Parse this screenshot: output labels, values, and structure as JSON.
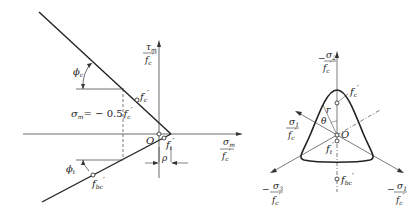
{
  "left_diagram": {
    "y_axis_label": {
      "num": "τ",
      "num_sub": "m",
      "den": "f",
      "den_sub": "c",
      "den_prime": "′"
    },
    "x_axis_label": {
      "num": "σ",
      "num_sub": "m",
      "den": "f",
      "den_sub": "c",
      "den_prime": "′"
    },
    "phi_c": {
      "sym": "ϕ",
      "sub": "c"
    },
    "phi_t": {
      "sym": "ϕ",
      "sub": "t"
    },
    "point_fc": {
      "sym": "f",
      "sub": "c",
      "prime": "′"
    },
    "point_ft": {
      "sym": "f",
      "sub": "t",
      "prime": "′"
    },
    "point_fbc": {
      "sym": "f",
      "sub": "bc",
      "prime": "′"
    },
    "origin": "O",
    "sigma_label": "σ",
    "sigma_sub": "m",
    "sigma_eq": "= − 0.5",
    "sigma_f": "f",
    "sigma_f_sub": "c",
    "sigma_f_prime": "′",
    "rho": "ρ"
  },
  "right_diagram": {
    "sigma2_label": {
      "num": "σ",
      "num_sub": "2",
      "den": "f",
      "den_sub": "c",
      "den_prime": "′",
      "sign": "−"
    },
    "sigma1_left_label": {
      "num": "σ",
      "num_sub": "1",
      "den": "f",
      "den_sub": "c",
      "den_prime": "′"
    },
    "sigma3_label": {
      "num": "σ",
      "num_sub": "3",
      "den": "f",
      "den_sub": "c",
      "den_prime": "′",
      "sign": "−"
    },
    "sigma1_right_label": {
      "num": "σ",
      "num_sub": "1",
      "den": "f",
      "den_sub": "c",
      "den_prime": "′",
      "sign": "−"
    },
    "r": "r",
    "theta": "θ",
    "origin": "O",
    "point_fc": {
      "sym": "f",
      "sub": "c",
      "prime": "′"
    },
    "point_ft": {
      "sym": "f",
      "sub": "t",
      "prime": "′"
    },
    "point_fbc": {
      "sym": "f",
      "sub": "bc",
      "prime": "′"
    }
  }
}
